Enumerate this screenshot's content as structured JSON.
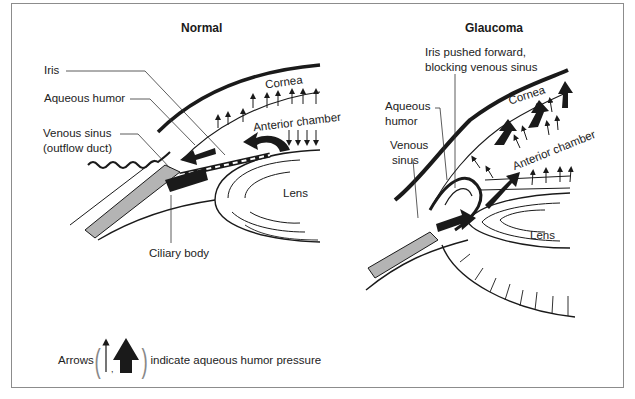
{
  "figure": {
    "panels": [
      {
        "id": "normal",
        "title": "Normal",
        "labels": {
          "iris": "Iris",
          "aqueous_humor": "Aqueous humor",
          "venous_sinus_line1": "Venous sinus",
          "venous_sinus_line2": "(outflow duct)",
          "cornea": "Cornea",
          "anterior_chamber": "Anterior chamber",
          "lens": "Lens",
          "ciliary_body": "Ciliary body"
        }
      },
      {
        "id": "glaucoma",
        "title": "Glaucoma",
        "labels": {
          "iris_pushed_line1": "Iris pushed forward,",
          "iris_pushed_line2": "blocking venous sinus",
          "aqueous_line1": "Aqueous",
          "aqueous_line2": "humor",
          "venous_line1": "Venous",
          "venous_line2": "sinus",
          "cornea": "Cornea",
          "anterior_chamber": "Anterior chamber",
          "lens": "Lens"
        }
      }
    ],
    "legend": {
      "prefix": "Arrows",
      "separator": ",",
      "suffix": "indicate aqueous humor pressure",
      "icons": [
        "thin-arrow-icon",
        "thick-arrow-icon"
      ]
    },
    "colors": {
      "frame": "#8c8c8c",
      "ink": "#1a1a1a",
      "sclera_fill": "#b4b4b4",
      "background": "#ffffff"
    }
  }
}
